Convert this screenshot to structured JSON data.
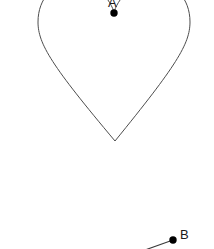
{
  "figure": {
    "title": "",
    "background_color": "#ffffff",
    "width": 214,
    "height": 249,
    "stroke_color": "#4d4d4d",
    "marker_color": "#000000",
    "line_color": "#3a3a3a",
    "shapes": [
      {
        "name": "heart-outline",
        "type": "heart",
        "stroke": "#4d4d4d",
        "stroke_width": 1,
        "fill": "none",
        "bounds": {
          "left": 38,
          "right": 190,
          "top": -18,
          "bottom": 141
        },
        "notch_point": {
          "x": 114,
          "y": 12
        },
        "bottom_point": {
          "x": 115,
          "y": 141
        }
      },
      {
        "name": "segment-to-b",
        "type": "line",
        "stroke": "#3a3a3a",
        "stroke_width": 1,
        "from": {
          "x": 146,
          "y": 250
        },
        "to": {
          "x": 173,
          "y": 240
        }
      }
    ],
    "points": [
      {
        "id": "A",
        "label": "A",
        "x": 114,
        "y": 13,
        "radius": 3.6,
        "color": "#000000",
        "label_offset": {
          "x": -6,
          "y": -17
        }
      },
      {
        "id": "B",
        "label": "B",
        "x": 173,
        "y": 240,
        "radius": 3.6,
        "color": "#000000",
        "label_offset": {
          "x": 7,
          "y": -12
        }
      }
    ]
  }
}
